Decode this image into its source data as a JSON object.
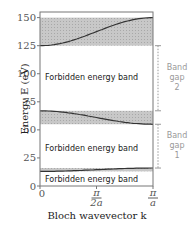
{
  "chart_data": {
    "type": "area",
    "title": "",
    "xlabel": "Bloch wavevector k",
    "ylabel": "Energy E (eV)",
    "ylim": [
      0,
      155
    ],
    "xlim": [
      0,
      1
    ],
    "yticks": [
      0,
      25,
      50,
      75,
      100,
      125,
      150
    ],
    "xticks": [
      {
        "value": 0,
        "label": "0"
      },
      {
        "value": 0.5,
        "label": "π/2a"
      },
      {
        "value": 1,
        "label": "π/a"
      }
    ],
    "allowed_bands": [
      {
        "name": "band-1",
        "bottom": 13,
        "top": 16,
        "curve_start": 13,
        "curve_end": 16
      },
      {
        "name": "band-2",
        "bottom": 55,
        "top": 67,
        "curve_start": 67,
        "curve_end": 55
      },
      {
        "name": "band-3",
        "bottom": 125,
        "top": 150,
        "curve_start": 125,
        "curve_end": 150
      }
    ],
    "forbidden_labels": [
      {
        "text": "Forbidden energy band",
        "y": 97
      },
      {
        "text": "Forbidden energy band",
        "y": 34
      },
      {
        "text": "Forbidden energy band",
        "y": 6
      }
    ],
    "gaps": [
      {
        "label": [
          "Band",
          "gap",
          "2"
        ],
        "from": 67,
        "to": 125
      },
      {
        "label": [
          "Band",
          "gap",
          "1"
        ],
        "from": 16,
        "to": 55
      }
    ]
  }
}
